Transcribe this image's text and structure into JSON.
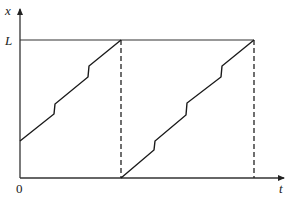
{
  "diagram": {
    "axes": {
      "y_label": "x",
      "x_label": "t",
      "origin_label": "0",
      "level_label": "L"
    },
    "segments": [
      {
        "name": "cycle-1",
        "points": [
          [
            20,
            141
          ],
          [
            54,
            114
          ],
          [
            55,
            104
          ],
          [
            88,
            77
          ],
          [
            89,
            66
          ],
          [
            121,
            40
          ]
        ]
      },
      {
        "name": "cycle-2",
        "points": [
          [
            121,
            178
          ],
          [
            154,
            150
          ],
          [
            155,
            141
          ],
          [
            186,
            115
          ],
          [
            187,
            103
          ],
          [
            221,
            77
          ],
          [
            222,
            66
          ],
          [
            254,
            40
          ]
        ]
      }
    ],
    "resets": [
      {
        "name": "reset-1",
        "x": 121,
        "y_top": 40,
        "y_bottom": 178
      },
      {
        "name": "reset-2",
        "x": 254,
        "y_top": 40,
        "y_bottom": 178
      }
    ],
    "level_line": {
      "y": 40,
      "x_start": 20,
      "x_end": 254
    }
  }
}
